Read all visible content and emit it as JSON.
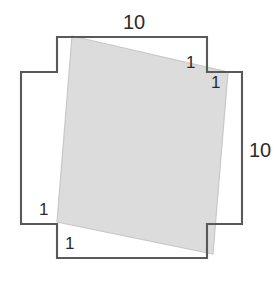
{
  "figure": {
    "colors": {
      "outline_stroke": "#595959",
      "tilted_fill": "#dcdcdc",
      "tilted_stroke": "#c8c8c8",
      "label_text": "#2b2b2b",
      "background": "#ffffff"
    },
    "outer_outline": {
      "shape_name": "notched-square-outline",
      "side_length": 10,
      "notch_size": 1,
      "points": "57,37 207,37 207,72 242,72 242,224 207,224 207,258 57,258 57,224 21,224 21,72 57,72 57,37"
    },
    "tilted_square": {
      "shape_name": "inscribed-tilted-square",
      "points": "72,36 228,72 213,254 57,222"
    },
    "labels": {
      "top_width": "10",
      "right_height": "10",
      "top_right_outer_step": "1",
      "top_right_inner_step": "1",
      "bottom_left_upper_step": "1",
      "bottom_left_lower_step": "1"
    }
  }
}
